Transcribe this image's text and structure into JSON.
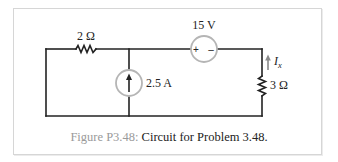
{
  "figure": {
    "caption_label": "Figure P3.48:",
    "caption_text": " Circuit for Problem 3.48."
  },
  "components": {
    "resistor_left": {
      "label": "2 Ω",
      "value_ohms": 2
    },
    "voltage_source": {
      "label": "15 V",
      "value_volts": 15,
      "plus": "+",
      "minus": "–"
    },
    "current_source": {
      "label": "2.5 A",
      "value_amps": 2.5,
      "direction": "up"
    },
    "resistor_right": {
      "label": "3 Ω",
      "value_ohms": 3
    },
    "current_indicator": {
      "symbol": "I",
      "subscript": "x",
      "direction": "up"
    }
  },
  "colors": {
    "wire": "#222222",
    "source_ring": "#b5b5b5",
    "arrow_gray": "#8a8a8a",
    "frame_border": "#d6d6d6",
    "caption_label": "#9a9a9a"
  }
}
